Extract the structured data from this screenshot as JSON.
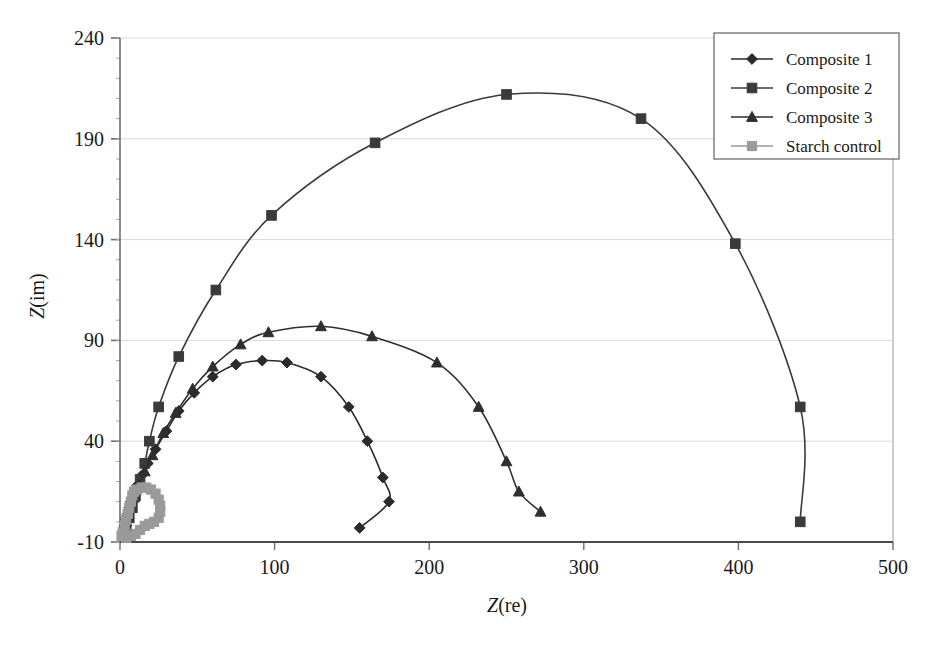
{
  "chart_data": {
    "type": "line",
    "title": "",
    "xlabel": "Z(re)",
    "ylabel": "Z(im)",
    "xlim": [
      0,
      500
    ],
    "ylim": [
      -10,
      240
    ],
    "xticks": [
      "0",
      "100",
      "200",
      "300",
      "400",
      "500"
    ],
    "yticks": [
      "-10",
      "40",
      "90",
      "140",
      "190",
      "240"
    ],
    "xtick_values": [
      0,
      100,
      200,
      300,
      400,
      500
    ],
    "ytick_values": [
      -10,
      40,
      90,
      140,
      190,
      240
    ],
    "grid": "horizontal",
    "legend_position": "top-right",
    "series": [
      {
        "name": "Composite 1",
        "marker": "diamond",
        "color": "#2b2b2b",
        "points": [
          [
            2,
            -5
          ],
          [
            3,
            -2
          ],
          [
            4,
            1
          ],
          [
            5,
            4
          ],
          [
            6,
            7
          ],
          [
            7,
            10
          ],
          [
            9,
            14
          ],
          [
            11,
            18
          ],
          [
            14,
            23
          ],
          [
            18,
            29
          ],
          [
            23,
            36
          ],
          [
            30,
            45
          ],
          [
            38,
            55
          ],
          [
            48,
            64
          ],
          [
            60,
            72
          ],
          [
            75,
            78
          ],
          [
            92,
            80
          ],
          [
            108,
            79
          ],
          [
            130,
            72
          ],
          [
            148,
            57
          ],
          [
            160,
            40
          ],
          [
            170,
            22
          ],
          [
            174,
            10
          ],
          [
            155,
            -3
          ]
        ]
      },
      {
        "name": "Composite 2",
        "marker": "square",
        "color": "#3a3a3a",
        "points": [
          [
            2,
            -6
          ],
          [
            4,
            -2
          ],
          [
            6,
            2
          ],
          [
            8,
            7
          ],
          [
            10,
            13
          ],
          [
            13,
            21
          ],
          [
            16,
            29
          ],
          [
            19,
            40
          ],
          [
            25,
            57
          ],
          [
            38,
            82
          ],
          [
            62,
            115
          ],
          [
            98,
            152
          ],
          [
            165,
            188
          ],
          [
            250,
            212
          ],
          [
            337,
            200
          ],
          [
            398,
            138
          ],
          [
            440,
            57
          ],
          [
            440,
            0
          ]
        ]
      },
      {
        "name": "Composite 3",
        "marker": "triangle",
        "color": "#2f2f2f",
        "points": [
          [
            2,
            -6
          ],
          [
            3,
            -3
          ],
          [
            4,
            0
          ],
          [
            5,
            3
          ],
          [
            7,
            7
          ],
          [
            9,
            12
          ],
          [
            12,
            18
          ],
          [
            16,
            25
          ],
          [
            21,
            33
          ],
          [
            28,
            44
          ],
          [
            36,
            54
          ],
          [
            47,
            66
          ],
          [
            60,
            77
          ],
          [
            78,
            88
          ],
          [
            96,
            94
          ],
          [
            130,
            97
          ],
          [
            163,
            92
          ],
          [
            205,
            79
          ],
          [
            232,
            57
          ],
          [
            250,
            30
          ],
          [
            258,
            15
          ],
          [
            272,
            5
          ]
        ]
      },
      {
        "name": "Starch control",
        "marker": "square-light",
        "color": "#9a9a9a",
        "points": [
          [
            1,
            -7
          ],
          [
            2,
            -5
          ],
          [
            3,
            -2
          ],
          [
            4,
            1
          ],
          [
            5,
            4
          ],
          [
            6,
            7
          ],
          [
            7,
            10
          ],
          [
            8,
            13
          ],
          [
            9,
            15
          ],
          [
            11,
            16
          ],
          [
            14,
            17
          ],
          [
            17,
            17
          ],
          [
            20,
            16
          ],
          [
            23,
            14
          ],
          [
            25,
            11
          ],
          [
            26,
            8
          ],
          [
            26,
            5
          ],
          [
            25,
            2
          ],
          [
            22,
            0
          ],
          [
            19,
            -1
          ],
          [
            16,
            -2
          ],
          [
            13,
            -4
          ],
          [
            10,
            -6
          ],
          [
            7,
            -7
          ],
          [
            4,
            -8
          ]
        ]
      }
    ]
  },
  "legend": {
    "items": [
      {
        "label": "Composite 1"
      },
      {
        "label": "Composite 2"
      },
      {
        "label": "Composite 3"
      },
      {
        "label": "Starch control"
      }
    ]
  },
  "axes": {
    "y_label_main": "Z",
    "y_label_sub": "(im)",
    "x_label_main": "Z",
    "x_label_sub": "(re)"
  }
}
